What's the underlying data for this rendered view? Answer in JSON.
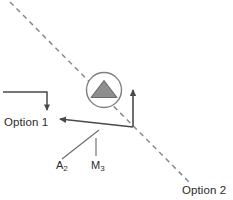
{
  "diagram": {
    "background_color": "#ffffff",
    "stroke_color": "#4a4a4a",
    "dashed_color": "#8a8a8a",
    "icon_fill_color": "#8e8e8e",
    "icon_stroke_color": "#6e6e6e",
    "text_color": "#2b2b2b"
  },
  "labels": {
    "option_1": "Option 1",
    "option_2": "Option 2",
    "a2_text": "A",
    "a2_sub": "2",
    "m3_text": "M",
    "m3_sub": "3"
  },
  "icons": {
    "marker": "circle-triangle-icon",
    "arrow_down": "arrow-down-icon",
    "arrow_up": "arrow-up-icon",
    "arrow_upleft": "arrow-up-left-icon",
    "dashed_path": "dashed-diagonal-line"
  },
  "geometry": {
    "dashed_line": {
      "x1": 10,
      "y1": 2,
      "x2": 190,
      "y2": 183
    },
    "marker_circle": {
      "cx": 104,
      "cy": 90,
      "r": 17.5
    },
    "marker_triangle": {
      "apex_x": 104,
      "apex_y": 81,
      "base_left_x": 91,
      "base_right_x": 117,
      "base_y": 97
    },
    "option1_elbow": {
      "x_start": 3,
      "y": 92,
      "x_corner": 47,
      "y_end": 113
    },
    "vertex": {
      "x": 133,
      "y": 127
    },
    "vertical_arrow": {
      "x": 133,
      "y_start": 127,
      "y_end": 87
    },
    "diagonal_arrow": {
      "x_start": 133,
      "y_start": 127,
      "x_end": 57,
      "y_end": 117
    },
    "a2_tick": {
      "x1": 62,
      "y1": 159,
      "x2": 99,
      "y2": 130
    },
    "m3_tick": {
      "x1": 96,
      "y1": 156,
      "x2": 96,
      "y2": 139
    }
  }
}
